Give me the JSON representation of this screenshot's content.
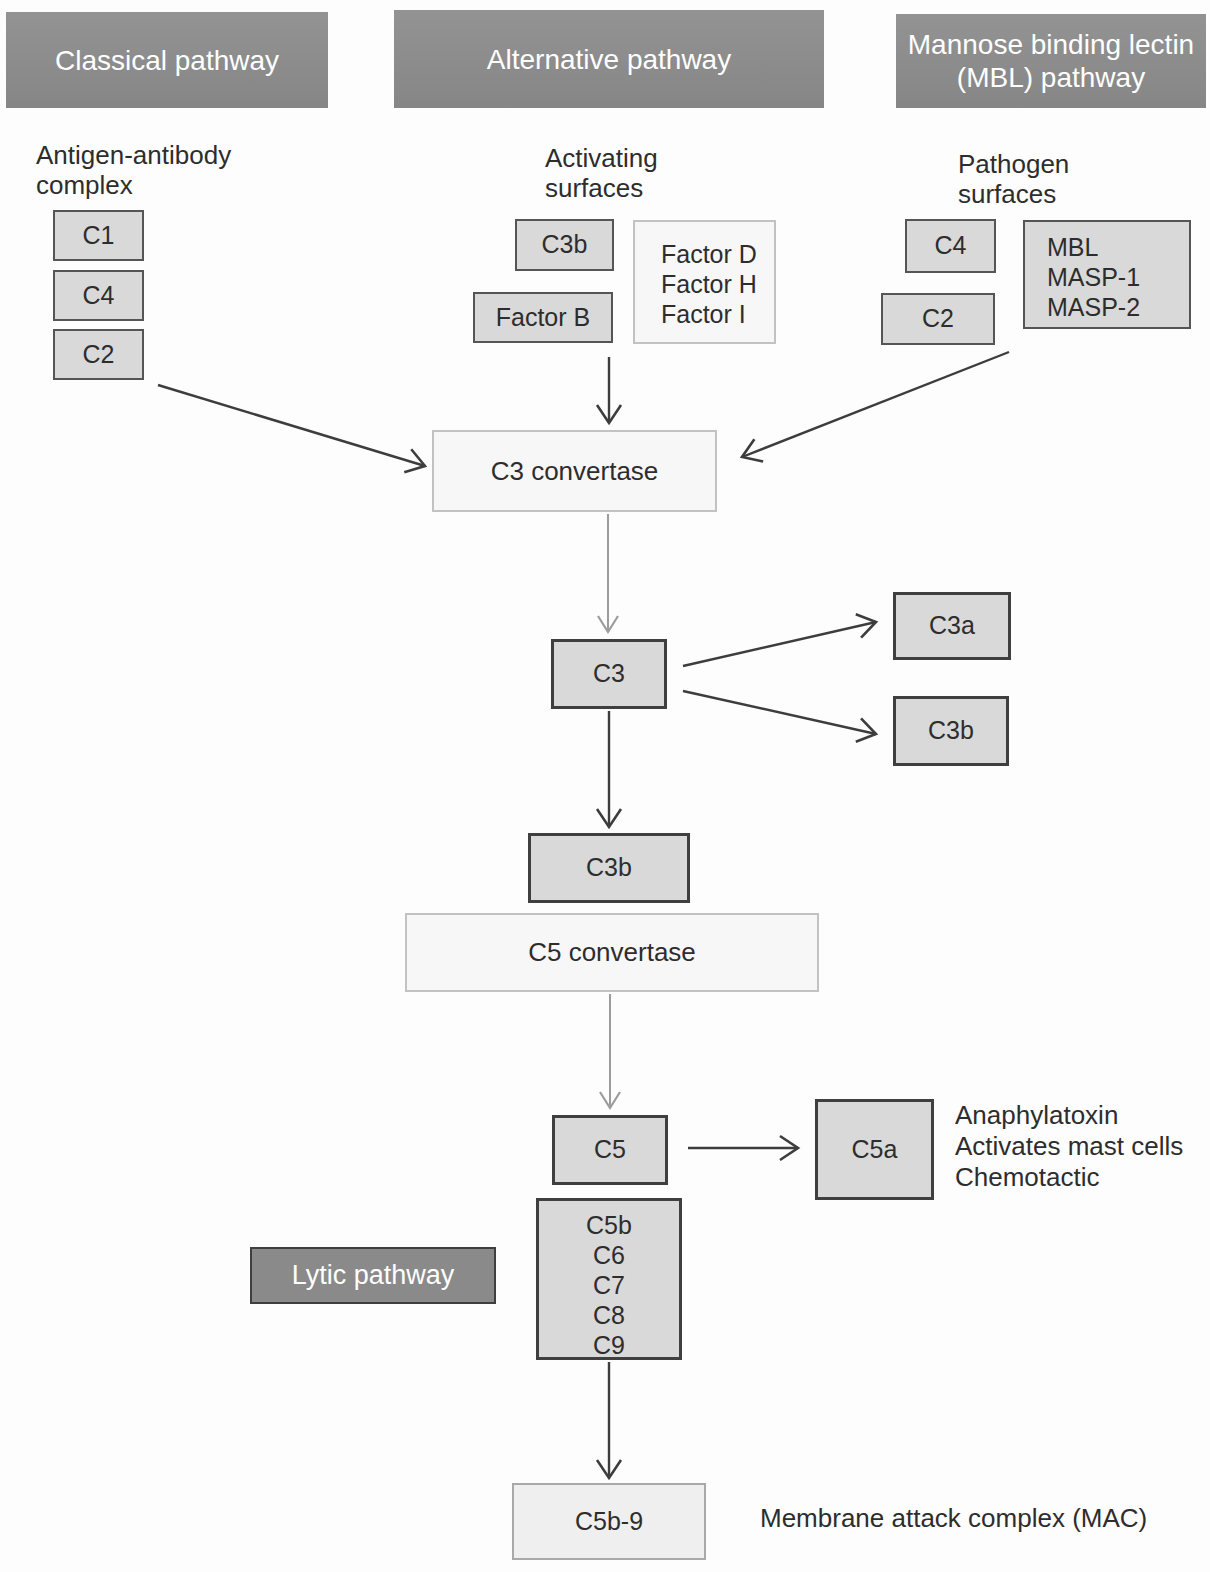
{
  "headers": {
    "classical": "Classical pathway",
    "alternative": "Alternative pathway",
    "mbl_line1": "Mannose binding lectin",
    "mbl_line2": "(MBL) pathway",
    "lytic": "Lytic pathway"
  },
  "labels": {
    "antigen_line1": "Antigen-antibody",
    "antigen_line2": "complex",
    "activating_line1": "Activating",
    "activating_line2": "surfaces",
    "pathogen_line1": "Pathogen",
    "pathogen_line2": "surfaces",
    "c5a_note_line1": "Anaphylatoxin",
    "c5a_note_line2": "Activates mast cells",
    "c5a_note_line3": "Chemotactic",
    "mac_note": "Membrane attack complex (MAC)"
  },
  "nodes": {
    "c1": "C1",
    "c4_left": "C4",
    "c2_left": "C2",
    "c3b_alt": "C3b",
    "factor_b": "Factor B",
    "factor_stack": [
      "Factor D",
      "Factor H",
      "Factor I"
    ],
    "c4_right": "C4",
    "c2_right": "C2",
    "mbl_stack": [
      "MBL",
      "MASP-1",
      "MASP-2"
    ],
    "c3_convertase": "C3 convertase",
    "c3": "C3",
    "c3a": "C3a",
    "c3b_right": "C3b",
    "c3b_main": "C3b",
    "c5_convertase": "C5 convertase",
    "c5": "C5",
    "c5a": "C5a",
    "c5b9_stack": [
      "C5b",
      "C6",
      "C7",
      "C8",
      "C9"
    ],
    "c5b9": "C5b-9"
  },
  "colors": {
    "header_bg": "#8c8c8c",
    "header_text": "#ffffff",
    "box_gray_bg": "#d9d9d9",
    "box_gray_border": "#4f4f4f",
    "box_light_bg": "#f7f7f7",
    "box_light_border": "#c2c2c2",
    "lytic_bg": "#8a8a8a",
    "arrow_dark": "#3d3d3d",
    "arrow_gray": "#9c9c9c",
    "text": "#2d2d2d"
  }
}
